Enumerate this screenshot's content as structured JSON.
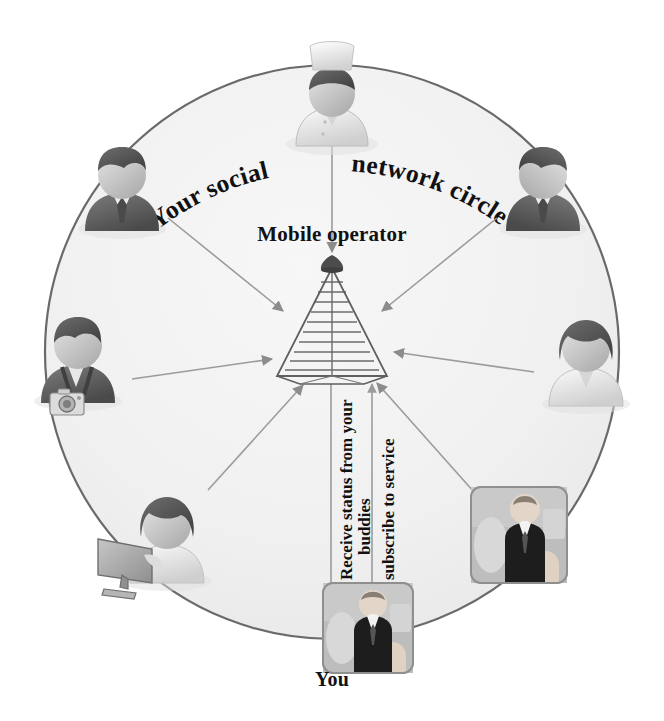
{
  "diagram": {
    "title_curved": "Your social network circle",
    "title_part_left": "Your social",
    "title_part_right": "network circle",
    "center_label": "Mobile operator",
    "you_label": "You",
    "flow_down_line1": "Receive status from your",
    "flow_down_line2": "buddies",
    "flow_up_line1": "subscribe to service",
    "colors": {
      "circle_fill": "#f2f2f2",
      "circle_stroke": "#6a6a6a",
      "page_background": "#ffffff",
      "text": "#111111",
      "arrow": "#8c8c8c",
      "tower_line": "#6b6b6b",
      "avatar_dark": "#5d5d5d",
      "avatar_mid": "#9a9a9a",
      "avatar_light": "#d8d8d8"
    },
    "circle": {
      "center_x": 332,
      "center_y": 352,
      "radius_x": 287,
      "radius_y": 287
    },
    "tower": {
      "apex_x": 332,
      "apex_y": 264,
      "base_y": 373,
      "half_width": 55,
      "rungs": 11
    },
    "members": [
      {
        "name": "chef",
        "id": "avatar-chef",
        "x": 332,
        "y": 100,
        "kind": "chef",
        "has_arrow_from_center": true
      },
      {
        "name": "businessman-left",
        "id": "avatar-businessman-left",
        "x": 122,
        "y": 185,
        "kind": "businessman",
        "has_arrow_from_center": false
      },
      {
        "name": "businessman-right",
        "id": "avatar-businessman-right",
        "x": 543,
        "y": 185,
        "kind": "businessman-mirror",
        "has_arrow_from_center": false
      },
      {
        "name": "photographer",
        "id": "avatar-photographer",
        "x": 78,
        "y": 355,
        "kind": "photographer",
        "has_arrow_from_center": false
      },
      {
        "name": "woman-right",
        "id": "avatar-woman-right",
        "x": 586,
        "y": 358,
        "kind": "woman",
        "has_arrow_from_center": false
      },
      {
        "name": "computer-user",
        "id": "avatar-computer-user",
        "x": 160,
        "y": 535,
        "kind": "computer",
        "has_arrow_from_center": false
      },
      {
        "name": "photo-buddy",
        "id": "photo-thumb-buddy",
        "x": 519,
        "y": 535,
        "kind": "photo",
        "has_arrow_from_center": false
      },
      {
        "name": "you",
        "id": "photo-thumb-you",
        "x": 368,
        "y": 628,
        "kind": "photo",
        "has_arrow_from_center": false
      }
    ]
  }
}
